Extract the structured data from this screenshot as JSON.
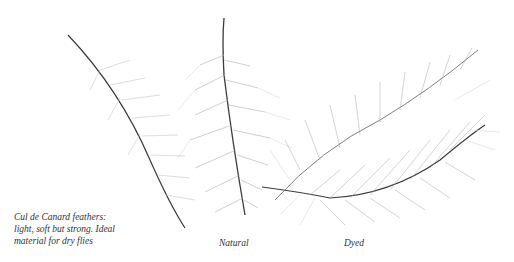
{
  "image": {
    "description": "Illustration of Cul de Canard feathers: two natural feathers on the left and a dyed feather on the right",
    "background": "#ffffff",
    "stroke_color": "#3a3a3a",
    "barb_color": "#9a9a9a"
  },
  "captions": {
    "main": {
      "lines": [
        "Cul de Canard feathers:",
        "light, soft but strong. Ideal",
        "material for dry flies"
      ]
    },
    "natural": "Natural",
    "dyed": "Dyed"
  }
}
